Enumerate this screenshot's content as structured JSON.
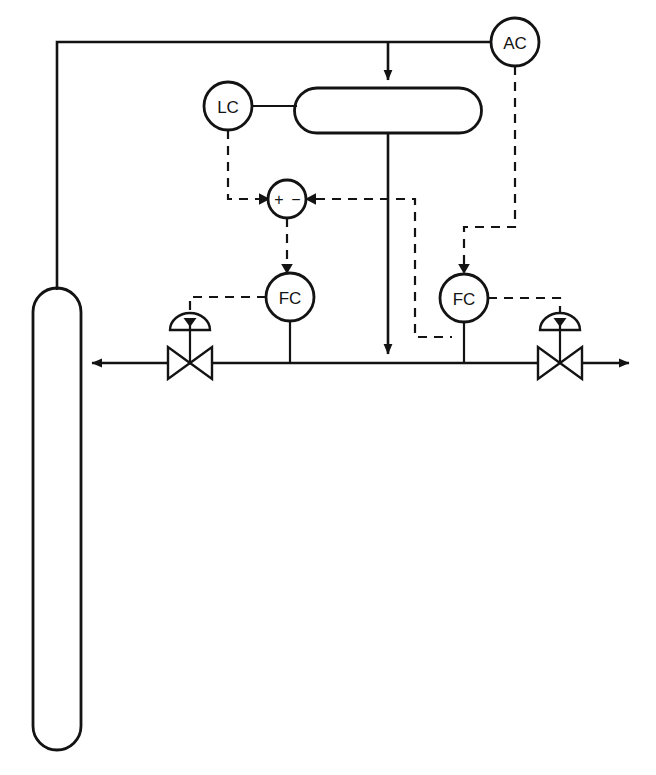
{
  "diagram": {
    "type": "process-and-instrumentation-diagram",
    "canvas": {
      "width": 656,
      "height": 775
    },
    "background_color": "#ffffff",
    "line_color": "#131313"
  },
  "instruments": {
    "analyzer_controller": {
      "tag": "AC",
      "name": "analyzer-controller",
      "cx": 515,
      "cy": 42,
      "r": 24
    },
    "level_controller": {
      "tag": "LC",
      "name": "level-controller",
      "cx": 228,
      "cy": 106,
      "r": 24
    },
    "summer": {
      "tag": "",
      "name": "summing-junction",
      "cx": 287,
      "cy": 199,
      "r": 19,
      "plus_sign": "+",
      "minus_sign": "−"
    },
    "flow_controller_left": {
      "tag": "FC",
      "name": "flow-controller-reflux",
      "cx": 290,
      "cy": 297,
      "r": 24
    },
    "flow_controller_right": {
      "tag": "FC",
      "name": "flow-controller-distillate",
      "cx": 464,
      "cy": 298,
      "r": 24
    }
  },
  "equipment": {
    "column": {
      "name": "distillation-column",
      "x": 33,
      "y": 288,
      "width": 48,
      "height": 462,
      "radius": 24
    },
    "reflux_drum": {
      "name": "reflux-drum",
      "x": 295,
      "y": 88,
      "width": 186,
      "height": 45,
      "radius": 22
    }
  },
  "valves": {
    "reflux_valve": {
      "name": "reflux-control-valve",
      "cx": 190,
      "cy": 363,
      "half_width": 22,
      "half_height": 16
    },
    "distillate_valve": {
      "name": "distillate-control-valve",
      "cx": 560,
      "cy": 363,
      "half_width": 22,
      "half_height": 16
    }
  },
  "streams": {
    "overhead_vapor_inlet": {
      "name": "overhead-vapor-to-drum",
      "label": ""
    },
    "drum_outlet": {
      "name": "drum-liquid-outlet",
      "label": ""
    },
    "reflux_return": {
      "name": "reflux-return-to-column",
      "label": ""
    },
    "distillate_product": {
      "name": "distillate-product-out",
      "label": ""
    },
    "analyzer_sample": {
      "name": "analyzer-sample-from-column-top",
      "label": ""
    }
  },
  "signals": [
    {
      "name": "lc-to-summer",
      "from": "LC",
      "to": "summing-junction",
      "style": "dashed"
    },
    {
      "name": "ac-to-fc-right",
      "from": "AC",
      "to": "flow-controller-distillate",
      "style": "dashed"
    },
    {
      "name": "summer-to-fc-left",
      "from": "summing-junction",
      "to": "flow-controller-reflux",
      "style": "dashed"
    },
    {
      "name": "fc-right-flow-signal-to-summer",
      "from": "flow-transmitter-distillate",
      "to": "summing-junction",
      "style": "dashed"
    },
    {
      "name": "fc-left-to-reflux-valve",
      "from": "flow-controller-reflux",
      "to": "reflux-control-valve",
      "style": "dashed"
    },
    {
      "name": "fc-right-to-distillate-valve",
      "from": "flow-controller-distillate",
      "to": "distillate-control-valve",
      "style": "dashed"
    }
  ],
  "caption": {
    "fragment": ""
  }
}
